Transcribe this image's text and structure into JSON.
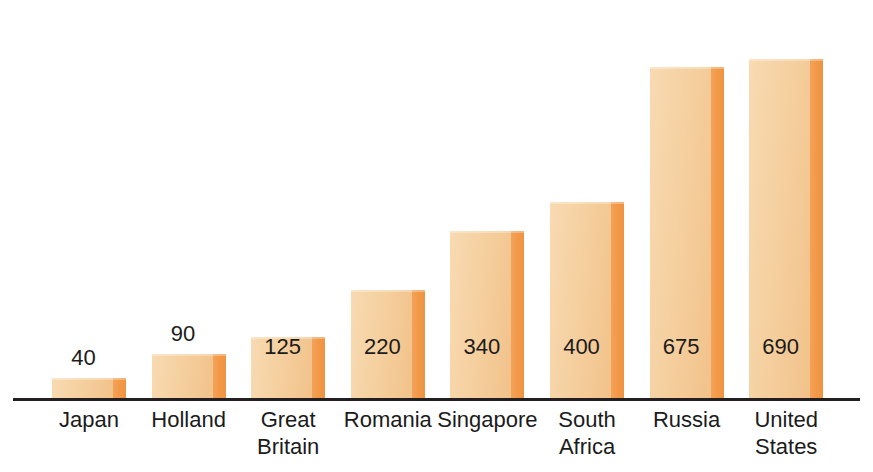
{
  "chart_data": {
    "type": "bar",
    "title": "",
    "subtitle": "",
    "xlabel": "",
    "ylabel": "",
    "grid": false,
    "legend": false,
    "orientation": "vertical",
    "ylim": [
      0,
      750
    ],
    "categories": [
      "Japan",
      "Holland",
      "Great\nBritain",
      "Romania",
      "Singapore",
      "South\nAfrica",
      "Russia",
      "United\nStates"
    ],
    "values": [
      40,
      90,
      125,
      220,
      340,
      400,
      675,
      690
    ],
    "value_labels": [
      "40",
      "90",
      "125",
      "220",
      "340",
      "400",
      "675",
      "690"
    ],
    "label_placement": [
      "above",
      "above",
      "inside",
      "inside",
      "inside",
      "inside",
      "inside",
      "inside"
    ],
    "bars": [
      {
        "category": "Japan",
        "label": "Japan",
        "value": 40,
        "value_label": "40",
        "placement": "above"
      },
      {
        "category": "Holland",
        "label": "Holland",
        "value": 90,
        "value_label": "90",
        "placement": "above"
      },
      {
        "category": "Great Britain",
        "label": "Great\nBritain",
        "value": 125,
        "value_label": "125",
        "placement": "inside"
      },
      {
        "category": "Romania",
        "label": "Romania",
        "value": 220,
        "value_label": "220",
        "placement": "inside"
      },
      {
        "category": "Singapore",
        "label": "Singapore",
        "value": 340,
        "value_label": "340",
        "placement": "inside"
      },
      {
        "category": "South Africa",
        "label": "South\nAfrica",
        "value": 400,
        "value_label": "400",
        "placement": "inside"
      },
      {
        "category": "Russia",
        "label": "Russia",
        "value": 675,
        "value_label": "675",
        "placement": "inside"
      },
      {
        "category": "United States",
        "label": "United\nStates",
        "value": 690,
        "value_label": "690",
        "placement": "inside"
      }
    ]
  },
  "colors": {
    "bar_body_light": "#f8dab2",
    "bar_body_mid": "#f5d0a0",
    "bar_body_dark": "#f2c28a",
    "bar_edge": "#f29a4a",
    "axis": "#231f20",
    "text": "#1b1b1b",
    "background": "#ffffff"
  },
  "top_sliver": {
    "text": ""
  }
}
